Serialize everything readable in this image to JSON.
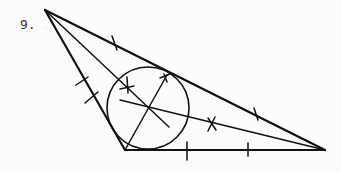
{
  "problem": {
    "number_label": "9."
  },
  "figure": {
    "vertices": {
      "A": [
        45,
        10
      ],
      "B": [
        125,
        150
      ],
      "C": [
        325,
        150
      ]
    },
    "incircle": {
      "cx": 148,
      "cy": 108,
      "r": 41
    },
    "stroke_color": "#111111"
  }
}
